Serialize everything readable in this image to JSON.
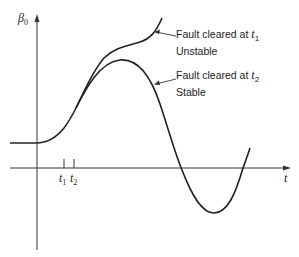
{
  "diagram": {
    "type": "swing-curve",
    "y_axis_label": {
      "symbol": "β",
      "subscript": "0"
    },
    "x_axis_label": "t",
    "ticks": [
      {
        "symbol": "t",
        "subscript": "1"
      },
      {
        "symbol": "t",
        "subscript": "2"
      }
    ],
    "curves": [
      {
        "name": "unstable",
        "label_line1_prefix": "Fault cleared at ",
        "label_symbol": "t",
        "label_subscript": "1",
        "label_line2": "Unstable"
      },
      {
        "name": "stable",
        "label_line1_prefix": "Fault cleared at ",
        "label_symbol": "t",
        "label_subscript": "2",
        "label_line2": "Stable"
      }
    ],
    "colors": {
      "line": "#222222",
      "background": "#ffffff"
    }
  }
}
